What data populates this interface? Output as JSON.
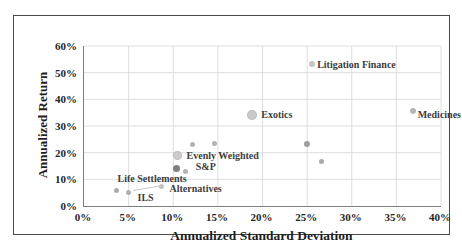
{
  "figure": {
    "background": "#ffffff",
    "border_color": "#4a4a4a",
    "axis_line_color": "#7d7d7d",
    "gridline_color": "#dedede",
    "leader_line_color": "#c9c9c9"
  },
  "chart_data": {
    "type": "scatter",
    "title": "",
    "xlabel": "Annualized Standard Deviation",
    "ylabel": "Annualized Return",
    "xlim": [
      0,
      40
    ],
    "ylim": [
      0,
      60
    ],
    "x_tick_step": 5,
    "y_tick_step": 10,
    "x_ticks": [
      "0%",
      "5%",
      "10%",
      "15%",
      "20%",
      "25%",
      "30%",
      "35%",
      "40%"
    ],
    "y_ticks": [
      "0%",
      "10%",
      "20%",
      "30%",
      "40%",
      "50%",
      "60%"
    ],
    "grid": true,
    "legend_position": "none",
    "points": [
      {
        "label": "Life Settlements",
        "x": 3.6,
        "y": 6.0,
        "size": 5,
        "color": "#ababab",
        "label_offset": [
          36,
          -12
        ]
      },
      {
        "label": "ILS",
        "x": 5.0,
        "y": 5.1,
        "size": 5,
        "color": "#b0b0b0",
        "label_offset": [
          17,
          5
        ]
      },
      {
        "label": "Alternatives",
        "x": 8.7,
        "y": 7.3,
        "size": 5,
        "color": "#c2c2c2",
        "label_offset": [
          34,
          1
        ]
      },
      {
        "label": "S&P",
        "x": 10.4,
        "y": 14.1,
        "size": 7,
        "color": "#7f7f7f",
        "label_offset": [
          29,
          -2
        ]
      },
      {
        "label": "",
        "x": 11.4,
        "y": 13.1,
        "size": 5,
        "color": "#b3b3b3"
      },
      {
        "label": "Evenly Weighted",
        "x": 10.5,
        "y": 18.8,
        "size": 9,
        "color": "#cbcbcb",
        "label_offset": [
          45,
          -1
        ]
      },
      {
        "label": "",
        "x": 12.2,
        "y": 22.9,
        "size": 5,
        "color": "#b3b3b3"
      },
      {
        "label": "",
        "x": 14.6,
        "y": 23.6,
        "size": 5,
        "color": "#b3b3b3"
      },
      {
        "label": "Exotics",
        "x": 18.8,
        "y": 34.2,
        "size": 10,
        "color": "#c9c9c9",
        "label_offset": [
          25,
          -1
        ]
      },
      {
        "label": "Litigation Finance",
        "x": 25.6,
        "y": 53.3,
        "size": 6,
        "color": "#c4c4c4",
        "label_offset": [
          44,
          0
        ]
      },
      {
        "label": "Medicines",
        "x": 36.9,
        "y": 35.6,
        "size": 6,
        "color": "#b5b5b5",
        "label_offset": [
          26,
          3
        ]
      },
      {
        "label": "",
        "x": 25.0,
        "y": 23.4,
        "size": 6,
        "color": "#9e9e9e"
      },
      {
        "label": "",
        "x": 26.6,
        "y": 16.8,
        "size": 5,
        "color": "#ababab"
      }
    ],
    "leader_line": {
      "x1": 5.5,
      "y1": 5.8,
      "x2": 8.7,
      "y2": 7.6
    }
  }
}
